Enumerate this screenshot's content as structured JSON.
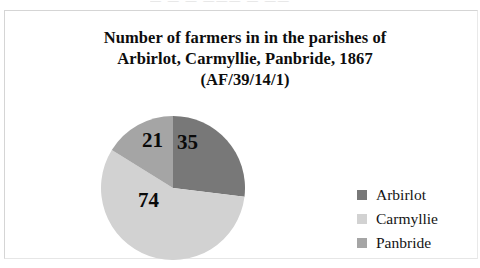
{
  "figure": {
    "title_lines": [
      "Number of farmers in in the parishes of",
      "Arbirlot, Carmyllie, Panbride, 1867",
      "(AF/39/14/1)"
    ],
    "page_remnant": "—   —   —   ———   —   ——"
  },
  "chart_data": {
    "type": "pie",
    "title": "Number of farmers in in the parishes of Arbirlot, Carmyllie, Panbride, 1867 (AF/39/14/1)",
    "xlabel": "",
    "ylabel": "",
    "legend_position": "right",
    "grid": false,
    "total": 130,
    "categories": [
      "Arbirlot",
      "Carmyllie",
      "Panbride"
    ],
    "values": [
      35,
      74,
      21
    ],
    "colors": [
      "#787878",
      "#d2d2d2",
      "#a5a5a5"
    ],
    "slices": [
      {
        "label": "Arbirlot",
        "value": 35,
        "display_value": "35",
        "color": "#787878",
        "start_angle": 0,
        "end_angle": 96.9,
        "percent": 26.9
      },
      {
        "label": "Carmyllie",
        "value": 74,
        "display_value": "74",
        "color": "#d2d2d2",
        "start_angle": 96.9,
        "end_angle": 301.8,
        "percent": 56.9
      },
      {
        "label": "Panbride",
        "value": 21,
        "display_value": "21",
        "color": "#a5a5a5",
        "start_angle": 301.8,
        "end_angle": 360,
        "percent": 16.2
      }
    ],
    "legend": [
      {
        "label": "Arbirlot",
        "color": "#787878"
      },
      {
        "label": "Carmyllie",
        "color": "#d2d2d2"
      },
      {
        "label": "Panbride",
        "color": "#a5a5a5"
      }
    ]
  }
}
